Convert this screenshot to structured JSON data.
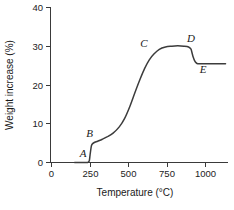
{
  "chart_data": {
    "type": "line",
    "title": "",
    "xlabel": "Temperature (°C)",
    "ylabel": "Weight increase (%)",
    "xlim": [
      0,
      1130
    ],
    "ylim": [
      0,
      40
    ],
    "grid": false,
    "legend": "none",
    "xticks": [
      0,
      250,
      500,
      750,
      1000
    ],
    "xtick_labels": [
      "0",
      "250",
      "500",
      "750",
      "1000"
    ],
    "yticks": [
      0,
      10,
      20,
      30,
      40
    ],
    "ytick_labels": [
      "0",
      "10",
      "20",
      "30",
      "40"
    ],
    "series": [
      {
        "name": "weight increase",
        "x": [
          150,
          200,
          235,
          245,
          250,
          256,
          262,
          275,
          300,
          330,
          360,
          400,
          440,
          475,
          510,
          545,
          575,
          605,
          635,
          665,
          700,
          740,
          780,
          820,
          860,
          890,
          905,
          912,
          920,
          930,
          940,
          950,
          980,
          1030,
          1080,
          1130
        ],
        "y": [
          0.0,
          0.0,
          0.0,
          0.4,
          1.8,
          3.6,
          4.6,
          5.1,
          5.5,
          6.0,
          6.6,
          7.6,
          9.2,
          11.4,
          14.6,
          18.4,
          21.5,
          24.3,
          26.5,
          28.0,
          29.2,
          29.8,
          30.0,
          30.1,
          30.0,
          29.8,
          29.3,
          28.4,
          27.2,
          26.2,
          25.7,
          25.5,
          25.5,
          25.5,
          25.5,
          25.5
        ]
      }
    ],
    "annotations": [
      {
        "label": "A",
        "x": 205,
        "y": 1.5,
        "note": "onset of weight gain near 250 °C"
      },
      {
        "label": "B",
        "x": 248,
        "y": 6.7,
        "note": "end of first rapid step, about 5 %"
      },
      {
        "label": "C",
        "x": 600,
        "y": 29.8,
        "note": "upper knee of main rise"
      },
      {
        "label": "D",
        "x": 905,
        "y": 31.0,
        "note": "plateau maximum, about 30 %"
      },
      {
        "label": "E",
        "x": 985,
        "y": 23.0,
        "note": "final plateau, about 25.5 %"
      }
    ]
  }
}
